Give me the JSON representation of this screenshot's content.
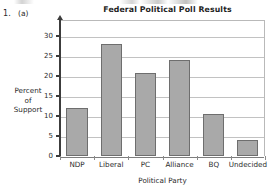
{
  "worksheet": {
    "item_number": "1.",
    "part_label": "(a)"
  },
  "chart_data": {
    "type": "bar",
    "title": "Federal Political Poll Results",
    "xlabel": "Political Party",
    "ylabel": "Percent of Support",
    "ylabel_lines": [
      "Percent",
      "of",
      "Support"
    ],
    "categories": [
      "NDP",
      "Liberal",
      "PC",
      "Alliance",
      "BQ",
      "Undecided"
    ],
    "values": [
      12,
      28,
      20.7,
      24,
      10.5,
      4
    ],
    "ylim": [
      0,
      34
    ],
    "yticks": [
      0,
      5,
      10,
      15,
      20,
      25,
      30
    ],
    "ytick_labels": [
      "0",
      "5",
      "10",
      "15",
      "20",
      "25",
      "30"
    ],
    "grid": true,
    "legend": "none",
    "bar_fill_color": "#a9a9a9",
    "bar_border_color": "#6e6e6e",
    "gridline_color": "#c2c2c2",
    "axis_color": "#3c3c3c"
  }
}
